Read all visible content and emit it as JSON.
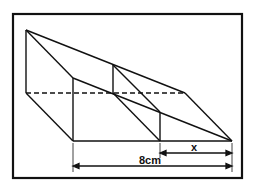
{
  "diagram": {
    "type": "3d-prism-cross-section",
    "labels": {
      "x_dimension": "x",
      "base_dimension": "8cm"
    },
    "colors": {
      "line": "#111111",
      "background": "#ffffff",
      "frame": "#111111"
    }
  }
}
